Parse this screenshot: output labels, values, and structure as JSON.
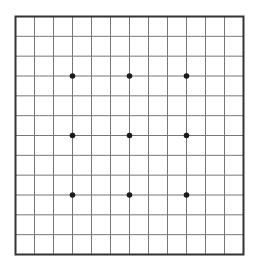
{
  "game": {
    "type": "go",
    "board_size": 13,
    "rows": 13,
    "cols": 13,
    "star_points": [
      [
        3,
        3
      ],
      [
        3,
        6
      ],
      [
        3,
        9
      ],
      [
        6,
        3
      ],
      [
        6,
        6
      ],
      [
        6,
        9
      ],
      [
        9,
        3
      ],
      [
        9,
        6
      ],
      [
        9,
        9
      ]
    ],
    "stones": [],
    "colors": {
      "background": "#ffffff",
      "border": "#333333",
      "grid_line": "#777777",
      "star_point": "#1a1a1a"
    }
  }
}
